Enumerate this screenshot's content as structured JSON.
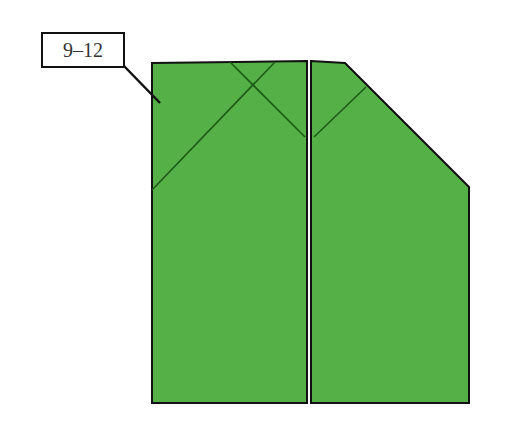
{
  "diagram": {
    "type": "origami-fold-diagram",
    "step_label": "9–12",
    "colors": {
      "paper": "#55b047",
      "edge": "#111111",
      "crease": "#1e5a17",
      "background": "#ffffff",
      "divider_gap": "#ffffff"
    },
    "left_panel": {
      "polygon": [
        [
          152,
          63
        ],
        [
          307,
          61
        ],
        [
          307,
          403
        ],
        [
          152,
          403
        ]
      ],
      "creases": [
        [
          [
            230,
            62
          ],
          [
            305,
            137
          ]
        ],
        [
          [
            275,
            62
          ],
          [
            152,
            190
          ]
        ]
      ]
    },
    "right_panel": {
      "polygon": [
        [
          311,
          61
        ],
        [
          345,
          63
        ],
        [
          469,
          187
        ],
        [
          469,
          403
        ],
        [
          311,
          403
        ]
      ],
      "creases": [
        [
          [
            366,
            87
          ],
          [
            314,
            137
          ]
        ]
      ]
    },
    "leader_line": [
      [
        124,
        66
      ],
      [
        160,
        103
      ]
    ]
  }
}
